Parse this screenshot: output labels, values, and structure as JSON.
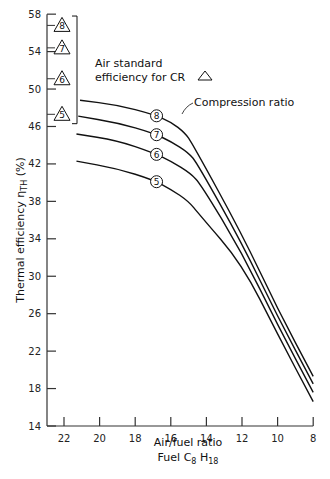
{
  "chart_data": {
    "type": "line",
    "title": "",
    "xlabel": "Air/fuel ratio",
    "xlabel_sub": "Fuel C8 H18",
    "ylabel": "Thermal efficiency η_TH (%)",
    "xlim": [
      22,
      8
    ],
    "ylim": [
      14,
      58
    ],
    "x_reversed": true,
    "x_ticks": [
      22,
      20,
      18,
      16,
      14,
      12,
      10,
      8
    ],
    "y_ticks": [
      14,
      18,
      22,
      26,
      30,
      34,
      38,
      42,
      46,
      50,
      54,
      58
    ],
    "grid": false,
    "series": [
      {
        "name": "8",
        "label": "CR 8",
        "x": [
          21.1,
          19,
          17,
          16,
          15.2,
          14.8,
          12,
          10,
          8
        ],
        "y": [
          48.8,
          48.3,
          47.3,
          46.5,
          45.3,
          44.2,
          34.5,
          26.5,
          19.3
        ]
      },
      {
        "name": "7",
        "label": "CR 7",
        "x": [
          21.2,
          19,
          17,
          16,
          15.0,
          14.5,
          12,
          10,
          8
        ],
        "y": [
          47.1,
          46.4,
          45.3,
          44.4,
          43.2,
          42.0,
          33.5,
          25.7,
          18.5
        ]
      },
      {
        "name": "6",
        "label": "CR 6",
        "x": [
          21.3,
          19,
          17,
          16,
          14.9,
          14.3,
          12,
          10,
          8
        ],
        "y": [
          45.2,
          44.5,
          43.2,
          42.3,
          41.0,
          39.8,
          32.5,
          24.8,
          17.6
        ]
      },
      {
        "name": "5",
        "label": "CR 5",
        "x": [
          21.3,
          19,
          17,
          16,
          15.0,
          14.4,
          12,
          10,
          8
        ],
        "y": [
          42.3,
          41.5,
          40.3,
          39.3,
          38.0,
          36.6,
          31.3,
          23.8,
          16.6
        ]
      }
    ],
    "air_standard_markers": [
      {
        "cr": "8",
        "y": 56.8
      },
      {
        "cr": "7",
        "y": 54.4
      },
      {
        "cr": "6",
        "y": 51.1
      },
      {
        "cr": "5",
        "y": 47.3
      }
    ],
    "annotations": [
      {
        "text": "Air standard",
        "note": "bracket label line 1"
      },
      {
        "text": "efficiency for CR △",
        "note": "bracket label line 2"
      },
      {
        "text": "Compression ratio",
        "note": "points to curve 8 label"
      }
    ]
  },
  "labels": {
    "x_axis": "Air/fuel ratio",
    "x_axis_sub_prefix": "Fuel C",
    "x_axis_sub_c": "8",
    "x_axis_sub_h": " H",
    "x_axis_sub_h_n": "18",
    "y_axis_main": "Thermal efficiency η",
    "y_axis_sub": "TH",
    "y_axis_unit": " (%)",
    "air_std_1": "Air standard",
    "air_std_2": "efficiency for CR",
    "compression_ratio": "Compression ratio"
  }
}
